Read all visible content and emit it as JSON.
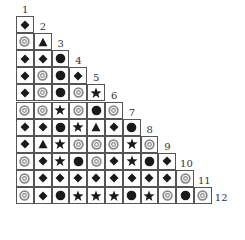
{
  "diagram": {
    "type": "triangular-symbol-grid",
    "column_labels": [
      "1",
      "2",
      "3",
      "4",
      "5",
      "6",
      "7",
      "8",
      "9",
      "10",
      "11",
      "12"
    ],
    "legend_symbols": {
      "D": "diamond-icon",
      "R": "ring-icon",
      "T": "triangle-icon",
      "C": "filled-circle-icon",
      "S": "star-icon"
    },
    "rows": [
      [
        "D"
      ],
      [
        "R",
        "T"
      ],
      [
        "D",
        "D",
        "C"
      ],
      [
        "D",
        "R",
        "C",
        "D"
      ],
      [
        "D",
        "R",
        "C",
        "R",
        "S"
      ],
      [
        "R",
        "R",
        "S",
        "R",
        "C",
        "R"
      ],
      [
        "D",
        "D",
        "C",
        "S",
        "T",
        "D",
        "C"
      ],
      [
        "D",
        "T",
        "S",
        "R",
        "R",
        "R",
        "S",
        "R"
      ],
      [
        "R",
        "D",
        "S",
        "C",
        "R",
        "D",
        "S",
        "C",
        "D"
      ],
      [
        "R",
        "D",
        "D",
        "D",
        "D",
        "D",
        "D",
        "D",
        "D",
        "R"
      ],
      [
        "R",
        "D",
        "C",
        "S",
        "S",
        "S",
        "C",
        "S",
        "R",
        "C",
        "R"
      ]
    ],
    "colors": {
      "ink": "#1a1a1a",
      "ring": "#8a8a8a",
      "grid": "#555555"
    }
  }
}
